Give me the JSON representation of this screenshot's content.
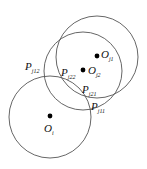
{
  "diagram": {
    "title": "",
    "stroke_color": "#555555",
    "point_color": "#000000",
    "circles": [
      {
        "id": "Oi",
        "cx": 50,
        "cy": 117,
        "r": 41
      },
      {
        "id": "Oj2",
        "cx": 83,
        "cy": 71,
        "r": 39
      },
      {
        "id": "Oj1",
        "cx": 97,
        "cy": 57,
        "r": 41
      }
    ],
    "centers": [
      {
        "id": "Oi",
        "x": 50,
        "y": 116,
        "main": "O",
        "sub": "i"
      },
      {
        "id": "Oj2",
        "x": 83,
        "y": 70,
        "main": "O",
        "sub": "j2"
      },
      {
        "id": "Oj1",
        "x": 97,
        "y": 56,
        "main": "O",
        "sub": "j1"
      }
    ],
    "labels": {
      "o_i": {
        "main": "O",
        "sub": "i"
      },
      "o_j1": {
        "main": "O",
        "sub": "j1"
      },
      "o_j2": {
        "main": "O",
        "sub": "j2"
      },
      "p_j1_2": {
        "main": "P",
        "sub": "j12"
      },
      "p_j2_2": {
        "main": "P",
        "sub": "j22"
      },
      "p_j2_1": {
        "main": "P",
        "sub": "j21"
      },
      "p_j1_1": {
        "main": "P",
        "sub": "j11"
      }
    }
  }
}
